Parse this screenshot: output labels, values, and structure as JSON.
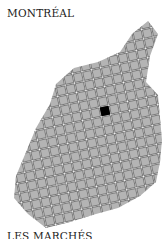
{
  "title": "MONTRÉAL",
  "footer": "LES MARCHÉS",
  "map": {
    "cell_fill": "#b4b4b4",
    "cell_stroke": "#6a6a6a",
    "highlight_fill": "#000000",
    "highlight_cell": {
      "cx": 105,
      "cy": 111
    },
    "rotation_deg": -12,
    "cell_pitch": 9.6
  }
}
